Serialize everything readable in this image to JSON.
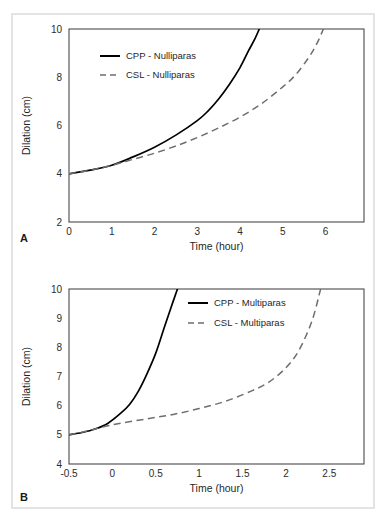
{
  "figure": {
    "panels": [
      {
        "letter": "A",
        "axes": {
          "xlabel": "Time (hour)",
          "ylabel": "Dilation (cm)",
          "xticks": [
            "0",
            "1",
            "2",
            "3",
            "4",
            "5",
            "6"
          ],
          "yticks": [
            "2",
            "4",
            "6",
            "8",
            "10"
          ]
        },
        "legend": [
          {
            "label": "CPP - Nulliparas",
            "style": "solid"
          },
          {
            "label": "CSL - Nulliparas",
            "style": "dashed"
          }
        ]
      },
      {
        "letter": "B",
        "axes": {
          "xlabel": "Time (hour)",
          "ylabel": "Dilation (cm)",
          "xticks": [
            "-0.5",
            "0",
            "0.5",
            "1",
            "1.5",
            "2",
            "2.5"
          ],
          "yticks": [
            "4",
            "5",
            "6",
            "7",
            "8",
            "9",
            "10"
          ]
        },
        "legend": [
          {
            "label": "CPP - Multiparas",
            "style": "solid"
          },
          {
            "label": "CSL - Multiparas",
            "style": "dashed"
          }
        ]
      }
    ],
    "colors": {
      "solid_curve": "#000000",
      "dashed_curve": "#6e6e6e",
      "frame": "#4a4a4a",
      "background": "#ffffff",
      "card_border": "#e4e4e4"
    }
  },
  "chart_data": [
    {
      "type": "line",
      "title": "",
      "panel": "A",
      "xlabel": "Time (hour)",
      "ylabel": "Dilation (cm)",
      "xlim": [
        0,
        6.9
      ],
      "ylim": [
        2,
        10
      ],
      "xticks": [
        0,
        1,
        2,
        3,
        4,
        5,
        6
      ],
      "yticks": [
        2,
        4,
        6,
        8,
        10
      ],
      "grid": false,
      "legend_position": "upper-left-inside",
      "series": [
        {
          "name": "CPP - Nulliparas",
          "style": "solid",
          "color": "#000000",
          "x": [
            0,
            0.5,
            1,
            1.5,
            2,
            2.5,
            3,
            3.25,
            3.5,
            3.75,
            4,
            4.2,
            4.35,
            4.45
          ],
          "y": [
            4.0,
            4.15,
            4.35,
            4.7,
            5.1,
            5.6,
            6.2,
            6.6,
            7.1,
            7.7,
            8.4,
            9.1,
            9.6,
            10.0
          ]
        },
        {
          "name": "CSL - Nulliparas",
          "style": "dashed",
          "color": "#6e6e6e",
          "x": [
            0,
            0.5,
            1,
            1.5,
            2,
            2.5,
            3,
            3.5,
            4,
            4.5,
            5,
            5.3,
            5.6,
            5.8,
            5.95
          ],
          "y": [
            4.0,
            4.15,
            4.35,
            4.6,
            4.85,
            5.15,
            5.5,
            5.9,
            6.35,
            6.9,
            7.6,
            8.1,
            8.8,
            9.4,
            10.0
          ]
        }
      ]
    },
    {
      "type": "line",
      "title": "",
      "panel": "B",
      "xlabel": "Time (hour)",
      "ylabel": "Dilation (cm)",
      "xlim": [
        -0.5,
        2.9
      ],
      "ylim": [
        4,
        10
      ],
      "xticks": [
        -0.5,
        0,
        0.5,
        1,
        1.5,
        2,
        2.5
      ],
      "yticks": [
        4,
        5,
        6,
        7,
        8,
        9,
        10
      ],
      "grid": false,
      "legend_position": "upper-center-inside",
      "series": [
        {
          "name": "CPP - Multiparas",
          "style": "solid",
          "color": "#000000",
          "x": [
            -0.5,
            -0.35,
            -0.2,
            -0.05,
            0.1,
            0.2,
            0.3,
            0.4,
            0.5,
            0.6,
            0.68,
            0.75
          ],
          "y": [
            5.0,
            5.08,
            5.2,
            5.4,
            5.75,
            6.05,
            6.5,
            7.1,
            7.8,
            8.7,
            9.4,
            10.0
          ]
        },
        {
          "name": "CSL - Multiparas",
          "style": "dashed",
          "color": "#6e6e6e",
          "x": [
            -0.5,
            -0.3,
            -0.1,
            0.1,
            0.4,
            0.7,
            1.0,
            1.3,
            1.6,
            1.8,
            2.0,
            2.15,
            2.3,
            2.4
          ],
          "y": [
            5.0,
            5.12,
            5.28,
            5.4,
            5.55,
            5.7,
            5.9,
            6.15,
            6.5,
            6.8,
            7.3,
            7.9,
            8.9,
            10.0
          ]
        }
      ]
    }
  ]
}
